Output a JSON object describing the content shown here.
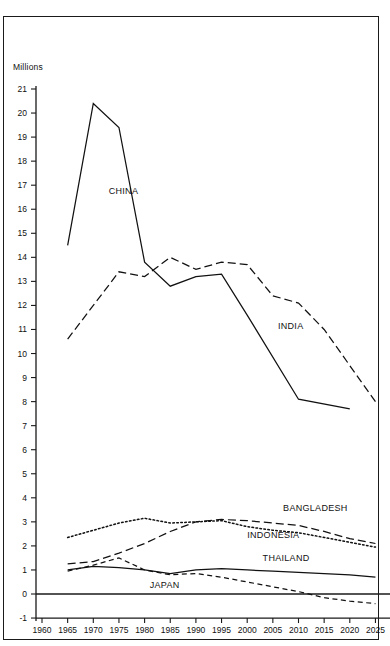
{
  "chart_data": {
    "type": "line",
    "title": "",
    "subtitle": "",
    "xlabel": "",
    "ylabel": "Millions",
    "ylim": [
      -1,
      21
    ],
    "xlim": [
      1960,
      2025
    ],
    "grid": false,
    "legend_position": "inline-labels",
    "y_ticks": [
      "21",
      "20",
      "19",
      "18",
      "17",
      "16",
      "15",
      "14",
      "13",
      "12",
      "11",
      "10",
      "9",
      "8",
      "7",
      "6",
      "5",
      "4",
      "3",
      "2",
      "1",
      "0",
      "-1"
    ],
    "x_ticks": [
      "1960",
      "1965",
      "1970",
      "1975",
      "1980",
      "1985",
      "1990",
      "1995",
      "2000",
      "2005",
      "2010",
      "2015",
      "2020",
      "2025"
    ],
    "zero_line": 0,
    "series": [
      {
        "name": "CHINA",
        "style": "solid",
        "x": [
          1965,
          1970,
          1975,
          1980,
          1985,
          1990,
          1995,
          2000,
          2010,
          2020
        ],
        "values": [
          14.5,
          20.4,
          19.4,
          13.8,
          12.8,
          13.2,
          13.3,
          11.6,
          8.1,
          7.7
        ],
        "label_x": 1973,
        "label_y": 16.7
      },
      {
        "name": "INDIA",
        "style": "dashed",
        "x": [
          1965,
          1970,
          1975,
          1980,
          1985,
          1990,
          1995,
          2000,
          2005,
          2010,
          2015,
          2020,
          2025
        ],
        "values": [
          10.6,
          12.0,
          13.4,
          13.2,
          14.0,
          13.5,
          13.8,
          13.7,
          12.4,
          12.1,
          11.0,
          9.5,
          8.0
        ],
        "label_x": 2006,
        "label_y": 11.1
      },
      {
        "name": "BANGLADESH",
        "style": "dashed",
        "x": [
          1965,
          1970,
          1975,
          1980,
          1985,
          1990,
          1995,
          2000,
          2005,
          2010,
          2015,
          2020,
          2025
        ],
        "values": [
          1.25,
          1.35,
          1.7,
          2.1,
          2.6,
          3.0,
          3.1,
          3.05,
          2.95,
          2.85,
          2.6,
          2.3,
          2.1
        ],
        "label_x": 2007,
        "label_y": 3.55
      },
      {
        "name": "INDONESIA",
        "style": "dotted",
        "x": [
          1965,
          1970,
          1975,
          1980,
          1985,
          1990,
          1995,
          2000,
          2005,
          2010,
          2015,
          2020,
          2025
        ],
        "values": [
          2.35,
          2.65,
          2.95,
          3.15,
          2.95,
          3.0,
          3.05,
          2.8,
          2.65,
          2.55,
          2.35,
          2.15,
          1.95
        ],
        "label_x": 2000,
        "label_y": 2.4
      },
      {
        "name": "THAILAND",
        "style": "solid",
        "x": [
          1965,
          1970,
          1975,
          1980,
          1985,
          1990,
          1995,
          2000,
          2005,
          2010,
          2015,
          2020,
          2025
        ],
        "values": [
          1.0,
          1.15,
          1.1,
          1.0,
          0.85,
          1.0,
          1.05,
          1.0,
          0.95,
          0.9,
          0.85,
          0.8,
          0.7
        ],
        "label_x": 2003,
        "label_y": 1.45
      },
      {
        "name": "JAPAN",
        "style": "shortdash",
        "x": [
          1965,
          1970,
          1975,
          1980,
          1985,
          1990,
          1995,
          2000,
          2005,
          2010,
          2015,
          2020,
          2025
        ],
        "values": [
          0.95,
          1.2,
          1.5,
          1.0,
          0.8,
          0.85,
          0.7,
          0.5,
          0.3,
          0.1,
          -0.15,
          -0.3,
          -0.4
        ],
        "label_x": 1981,
        "label_y": 0.35
      }
    ],
    "axis_color": "#1a1a1a",
    "line_color": "#111111"
  }
}
